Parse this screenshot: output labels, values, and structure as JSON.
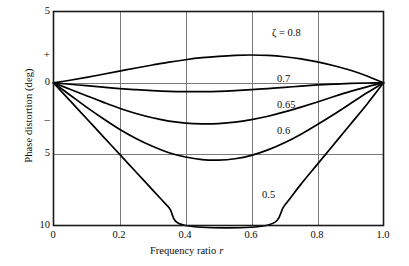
{
  "chart_data": {
    "type": "line",
    "title": "",
    "xlabel": "Frequency ratio r",
    "ylabel": "Phase distortion (deg)",
    "xlim": [
      0,
      1.0
    ],
    "ylim": [
      -10,
      5
    ],
    "y_axis_note": "Positive above zero line (+), negative below (−); labels show magnitude only",
    "grid": true,
    "legend": "inline-curve-labels",
    "x_ticks": [
      "0",
      "0.2",
      "0.4",
      "0.6",
      "0.8",
      "1.0"
    ],
    "x_tick_values": [
      0,
      0.2,
      0.4,
      0.6,
      0.8,
      1.0
    ],
    "y_ticks": [
      "5",
      "0",
      "5",
      "10"
    ],
    "y_tick_values": [
      5,
      0,
      -5,
      -10
    ],
    "y_sign_plus": "+",
    "y_sign_minus": "–",
    "series": [
      {
        "name": "ζ = 0.8",
        "label": "ζ = 0.8",
        "damping_ratio": 0.8,
        "x": [
          0,
          0.05,
          0.1,
          0.15,
          0.2,
          0.25,
          0.3,
          0.35,
          0.4,
          0.45,
          0.5,
          0.55,
          0.6,
          0.65,
          0.7,
          0.75,
          0.8,
          0.85,
          0.9,
          0.95,
          1.0
        ],
        "y": [
          0,
          0.18,
          0.38,
          0.6,
          0.82,
          1.04,
          1.25,
          1.45,
          1.62,
          1.76,
          1.86,
          1.93,
          1.95,
          1.92,
          1.83,
          1.68,
          1.47,
          1.2,
          0.88,
          0.48,
          0
        ]
      },
      {
        "name": "0.7",
        "label": "0.7",
        "damping_ratio": 0.7,
        "x": [
          0,
          0.05,
          0.1,
          0.15,
          0.2,
          0.25,
          0.3,
          0.35,
          0.4,
          0.45,
          0.5,
          0.55,
          0.6,
          0.65,
          0.7,
          0.75,
          0.8,
          0.85,
          0.9,
          0.95,
          1.0
        ],
        "y": [
          0,
          -0.1,
          -0.2,
          -0.3,
          -0.4,
          -0.48,
          -0.55,
          -0.6,
          -0.62,
          -0.62,
          -0.6,
          -0.55,
          -0.48,
          -0.4,
          -0.32,
          -0.23,
          -0.15,
          -0.09,
          -0.04,
          -0.01,
          0
        ]
      },
      {
        "name": "0.65",
        "label": "0.65",
        "damping_ratio": 0.65,
        "x": [
          0,
          0.05,
          0.1,
          0.15,
          0.2,
          0.25,
          0.3,
          0.35,
          0.4,
          0.45,
          0.5,
          0.55,
          0.6,
          0.65,
          0.7,
          0.75,
          0.8,
          0.85,
          0.9,
          0.95,
          1.0
        ],
        "y": [
          0,
          -0.45,
          -0.9,
          -1.35,
          -1.78,
          -2.15,
          -2.45,
          -2.68,
          -2.82,
          -2.88,
          -2.86,
          -2.76,
          -2.58,
          -2.34,
          -2.04,
          -1.7,
          -1.34,
          -0.96,
          -0.6,
          -0.28,
          0
        ]
      },
      {
        "name": "0.6",
        "label": "0.6",
        "damping_ratio": 0.6,
        "x": [
          0,
          0.05,
          0.1,
          0.15,
          0.2,
          0.25,
          0.3,
          0.35,
          0.4,
          0.45,
          0.5,
          0.55,
          0.6,
          0.65,
          0.7,
          0.75,
          0.8,
          0.85,
          0.9,
          0.95,
          1.0
        ],
        "y": [
          0,
          -0.85,
          -1.7,
          -2.5,
          -3.25,
          -3.9,
          -4.45,
          -4.9,
          -5.2,
          -5.38,
          -5.42,
          -5.32,
          -5.08,
          -4.7,
          -4.2,
          -3.6,
          -2.92,
          -2.2,
          -1.45,
          -0.7,
          0
        ]
      },
      {
        "name": "0.5",
        "label": "0.5",
        "damping_ratio": 0.5,
        "x": [
          0,
          0.05,
          0.1,
          0.15,
          0.2,
          0.25,
          0.3,
          0.35,
          0.4,
          0.645,
          0.7,
          0.75,
          0.8,
          0.85,
          0.9,
          0.95,
          1.0
        ],
        "y": [
          0,
          -1.25,
          -2.5,
          -3.75,
          -5.0,
          -6.25,
          -7.5,
          -8.75,
          -10.0,
          -10.0,
          -8.6,
          -7.1,
          -5.7,
          -4.3,
          -2.9,
          -1.5,
          0
        ],
        "note": "curve exits bottom of axes near r=0.40 and re-enters near r=0.645"
      }
    ],
    "curve_label_positions": [
      {
        "label_key": "l0",
        "x": 272,
        "y": 27
      },
      {
        "label_key": "l1",
        "x": 276,
        "y": 73
      },
      {
        "label_key": "l2",
        "x": 277,
        "y": 99
      },
      {
        "label_key": "l3",
        "x": 277,
        "y": 125
      },
      {
        "label_key": "l4",
        "x": 262,
        "y": 189
      }
    ]
  },
  "axis": {
    "ylabel": "Phase distortion (deg)",
    "xlabel_main": "Frequency ratio",
    "xlabel_var": "r",
    "plus": "+",
    "minus": "–",
    "yticks": {
      "t0": "5",
      "t1": "0",
      "t2": "5",
      "t3": "10"
    },
    "xticks": {
      "t0": "0",
      "t1": "0.2",
      "t2": "0.4",
      "t3": "0.6",
      "t4": "0.8",
      "t5": "1.0"
    }
  },
  "curve_labels": {
    "l0": "ζ = 0.8",
    "l1": "0.7",
    "l2": "0.65",
    "l3": "0.6",
    "l4": "0.5"
  },
  "colors": {
    "curve": "#000000",
    "frame": "#1a1a1a",
    "grid": "#7a7a7a",
    "background": "#ffffff",
    "text": "#0d0d0d"
  }
}
